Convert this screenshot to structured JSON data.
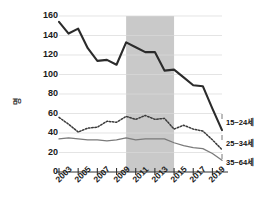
{
  "chart_data": {
    "type": "line",
    "title": "",
    "xlabel": "",
    "ylabel": "명",
    "ylim": [
      0,
      160
    ],
    "xlim": [
      2003,
      2020
    ],
    "grid": true,
    "legend_position": "right",
    "x": [
      2003,
      2004,
      2005,
      2006,
      2007,
      2008,
      2009,
      2010,
      2011,
      2012,
      2013,
      2014,
      2015,
      2016,
      2017,
      2018,
      2019,
      2020
    ],
    "xticklabels": [
      "2003",
      "2005",
      "2007",
      "2009",
      "2011",
      "2013",
      "2015",
      "2017",
      "2019"
    ],
    "xtickvalues": [
      2003,
      2005,
      2007,
      2009,
      2011,
      2013,
      2015,
      2017,
      2019
    ],
    "yticklabels": [
      "0",
      "20",
      "40",
      "60",
      "80",
      "100",
      "120",
      "140",
      "160"
    ],
    "ytickvalues": [
      0,
      20,
      40,
      60,
      80,
      100,
      120,
      140,
      160
    ],
    "shaded_band": {
      "x0": 2010,
      "x1": 2015,
      "color": "#c9c9c9"
    },
    "series": [
      {
        "name": "35~64세",
        "style": "solid-thick",
        "color": "#2b2b2b",
        "values": [
          154,
          142,
          147,
          127,
          114,
          115,
          110,
          133,
          128,
          123,
          123,
          104,
          105,
          97,
          89,
          88,
          65,
          43
        ]
      },
      {
        "name": "15~24세",
        "style": "dotted",
        "color": "#3a3a3a",
        "values": [
          56,
          49,
          41,
          45,
          46,
          52,
          51,
          57,
          54,
          58,
          54,
          55,
          44,
          48,
          44,
          42,
          33,
          23
        ]
      },
      {
        "name": "25~34세",
        "style": "solid-thin",
        "color": "#7a7a7a",
        "values": [
          34,
          35,
          34,
          33,
          33,
          32,
          33,
          35,
          33,
          34,
          34,
          34,
          30,
          27,
          25,
          24,
          19,
          12
        ]
      }
    ]
  },
  "legend": {
    "items": [
      {
        "label": "15~24세"
      },
      {
        "label": "25~34세"
      },
      {
        "label": "35~64세"
      }
    ]
  },
  "axis": {
    "y_title": "명"
  }
}
